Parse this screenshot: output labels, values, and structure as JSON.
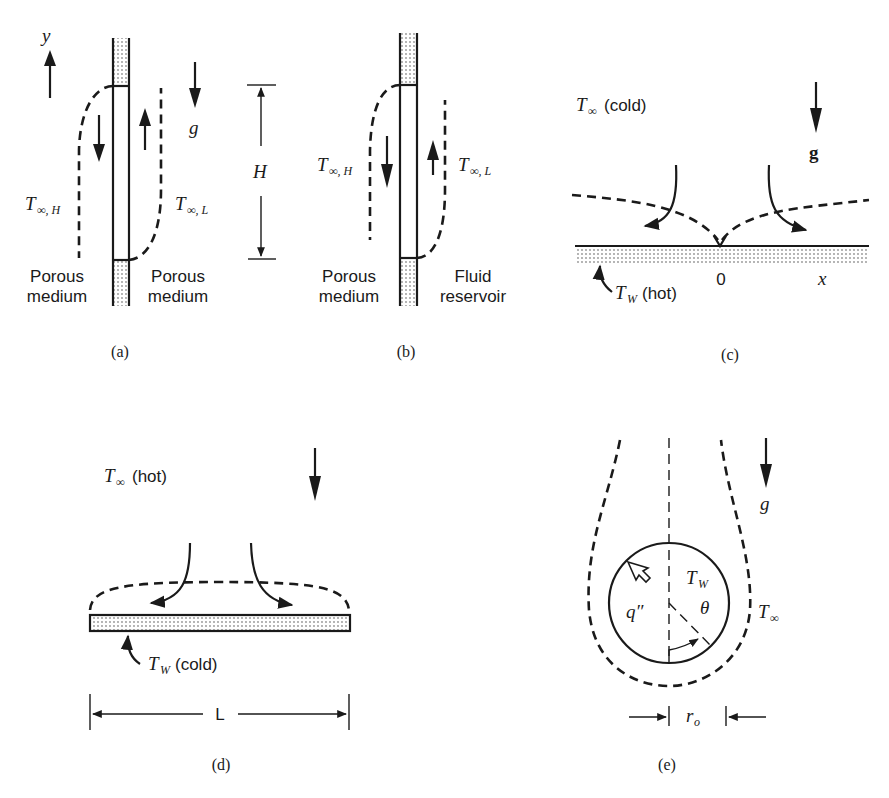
{
  "figure": {
    "panels": [
      {
        "id": "a",
        "caption": "(a)",
        "axis_label": "y",
        "gravity_label": "g",
        "height_label": "H",
        "left_temp": {
          "T": "T",
          "sub": "∞, H"
        },
        "right_temp": {
          "T": "T",
          "sub": "∞, L"
        },
        "left_medium": [
          "Porous",
          "medium"
        ],
        "right_medium": [
          "Porous",
          "medium"
        ]
      },
      {
        "id": "b",
        "caption": "(b)",
        "left_temp": {
          "T": "T",
          "sub": "∞, H"
        },
        "right_temp": {
          "T": "T",
          "sub": "∞, L"
        },
        "left_medium": [
          "Porous",
          "medium"
        ],
        "right_medium": [
          "Fluid",
          "reservoir"
        ]
      },
      {
        "id": "c",
        "caption": "(c)",
        "ambient": {
          "T": "T",
          "sub": "∞",
          "note": "(cold)"
        },
        "gravity_label": "g",
        "wall": {
          "T": "T",
          "sub": "W",
          "note": "(hot)"
        },
        "origin_label": "0",
        "x_label": "x"
      },
      {
        "id": "d",
        "caption": "(d)",
        "ambient": {
          "T": "T",
          "sub": "∞",
          "note": "(hot)"
        },
        "wall": {
          "T": "T",
          "sub": "W",
          "note": "(cold)"
        },
        "length_label": "L"
      },
      {
        "id": "e",
        "caption": "(e)",
        "gravity_label": "g",
        "wall_temp": {
          "T": "T",
          "sub": "W"
        },
        "heat_flux": "q″",
        "angle": "θ",
        "ambient": {
          "T": "T",
          "sub": "∞"
        },
        "radius": {
          "r": "r",
          "sub": "o"
        }
      }
    ]
  }
}
